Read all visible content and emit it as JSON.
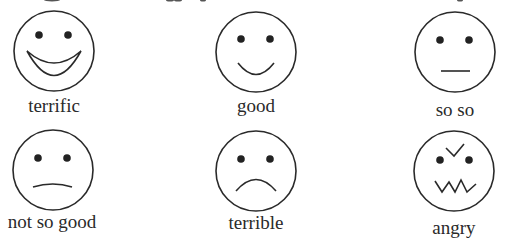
{
  "faces": [
    {
      "id": "terrific",
      "label": "terrific",
      "mouth": "big-grin"
    },
    {
      "id": "good",
      "label": "good",
      "mouth": "smile"
    },
    {
      "id": "so-so",
      "label": "so so",
      "mouth": "flat"
    },
    {
      "id": "not-so-good",
      "label": "not so good",
      "mouth": "slight-frown"
    },
    {
      "id": "terrible",
      "label": "terrible",
      "mouth": "frown"
    },
    {
      "id": "angry",
      "label": "angry",
      "mouth": "zigzag",
      "brows": "v-shape"
    }
  ],
  "colors": {
    "stroke": "#2a2a2a",
    "background": "#ffffff"
  }
}
